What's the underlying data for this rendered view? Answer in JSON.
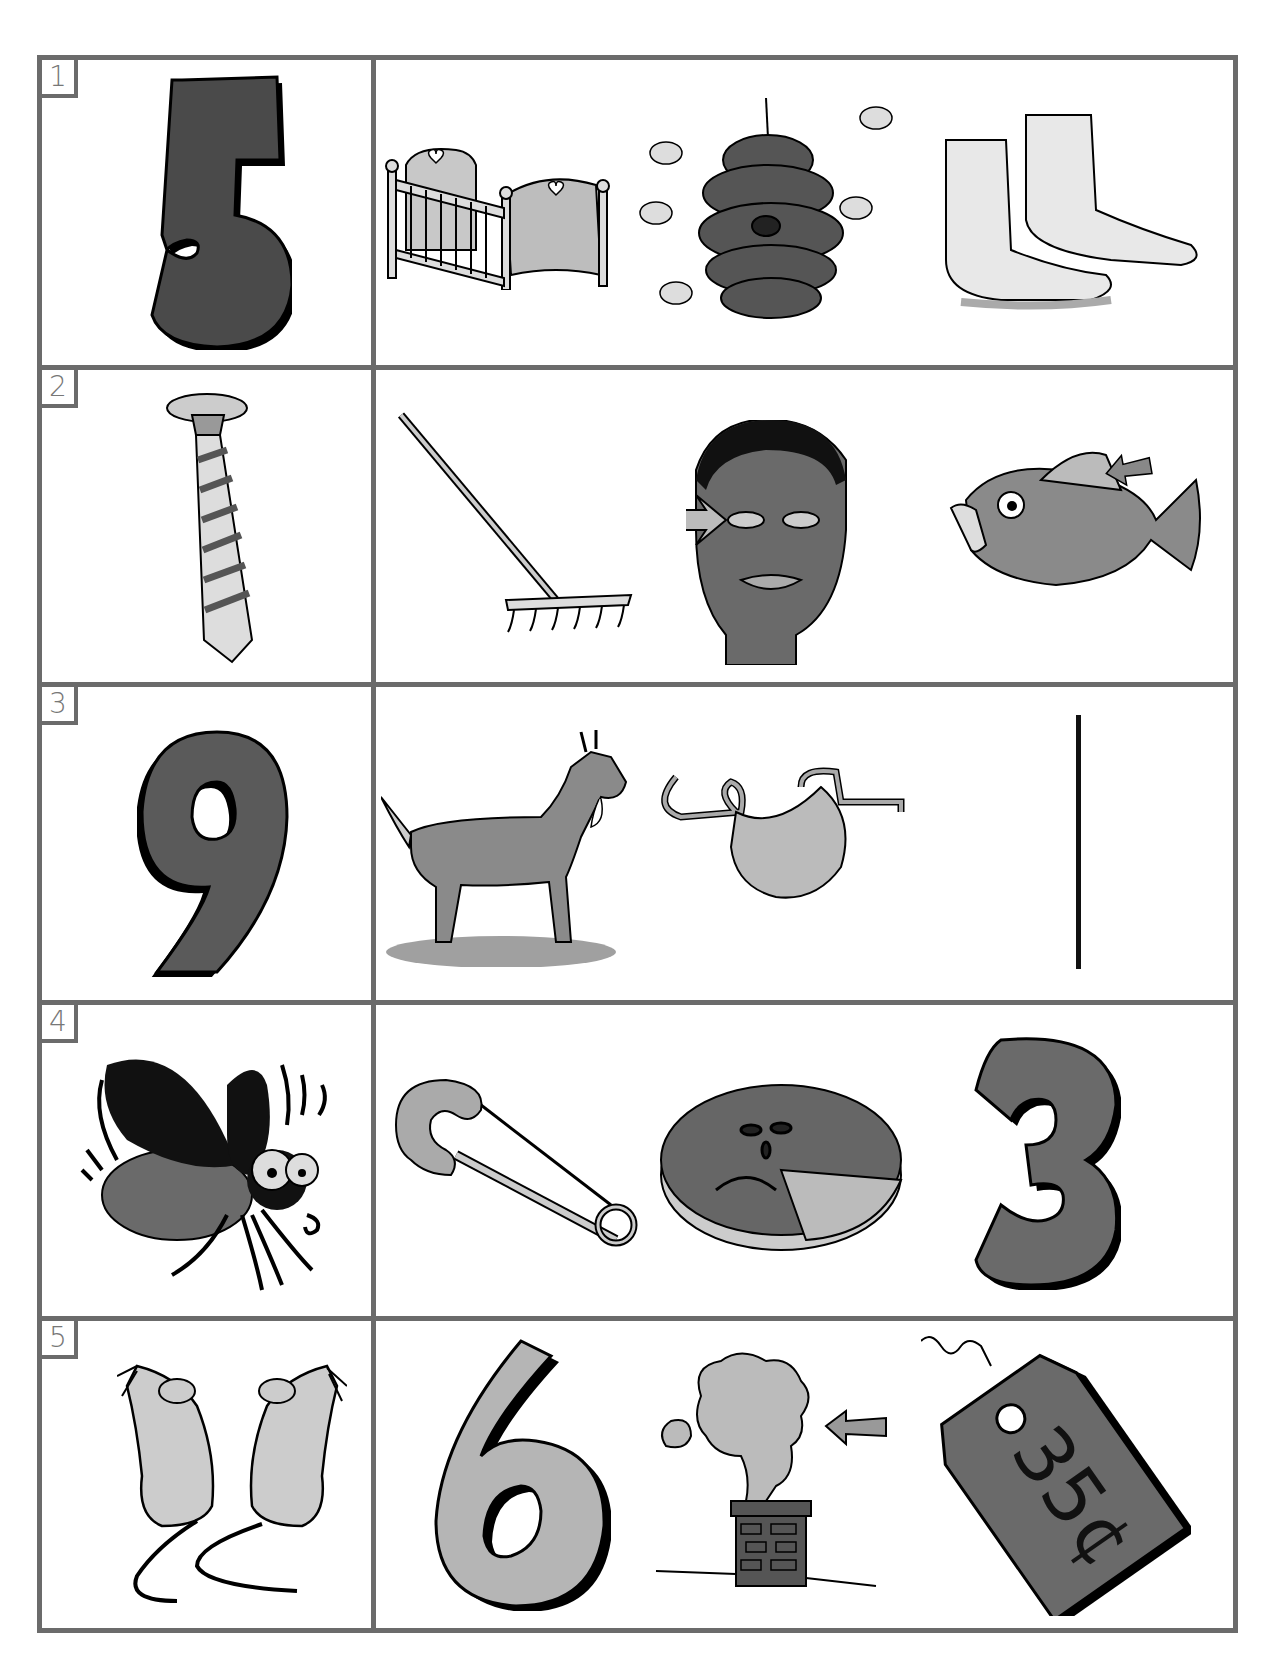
{
  "worksheet": {
    "rows": [
      {
        "number": "1",
        "key": {
          "name": "five",
          "glyph": "5",
          "fill": "#4a4a4a"
        },
        "choices": [
          {
            "name": "crib"
          },
          {
            "name": "beehive"
          },
          {
            "name": "feet"
          }
        ]
      },
      {
        "number": "2",
        "key": {
          "name": "tie"
        },
        "choices": [
          {
            "name": "rake"
          },
          {
            "name": "eye"
          },
          {
            "name": "fish-fin"
          }
        ]
      },
      {
        "number": "3",
        "key": {
          "name": "nine",
          "glyph": "9",
          "fill": "#5a5a5a"
        },
        "choices": [
          {
            "name": "goat"
          },
          {
            "name": "apron"
          },
          {
            "name": "line"
          }
        ]
      },
      {
        "number": "4",
        "key": {
          "name": "fly"
        },
        "choices": [
          {
            "name": "safety-pin"
          },
          {
            "name": "pie"
          },
          {
            "name": "three",
            "glyph": "3",
            "fill": "#6a6a6a"
          }
        ]
      },
      {
        "number": "5",
        "key": {
          "name": "mice"
        },
        "choices": [
          {
            "name": "six",
            "glyph": "6",
            "fill": "#b5b5b5"
          },
          {
            "name": "smoke"
          },
          {
            "name": "price-tag",
            "text": "35¢"
          }
        ]
      }
    ]
  },
  "colors": {
    "border": "#6b6b6b",
    "label_text": "#777777",
    "ink": "#111111"
  }
}
